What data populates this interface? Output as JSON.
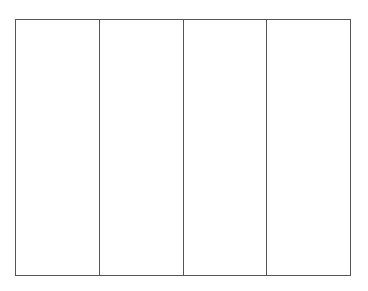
{
  "diagram": {
    "type": "empty-column-grid",
    "columns": [
      {
        "label": ""
      },
      {
        "label": ""
      },
      {
        "label": ""
      },
      {
        "label": ""
      }
    ],
    "colors": {
      "border": "#555555",
      "background": "#ffffff"
    }
  }
}
